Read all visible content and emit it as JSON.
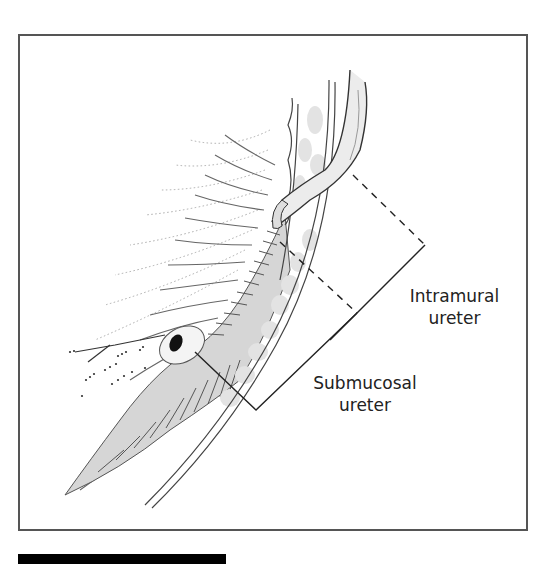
{
  "figure": {
    "labels": {
      "intramural": {
        "line1": "Intramural",
        "line2": "ureter"
      },
      "submucosal": {
        "line1": "Submucosal",
        "line2": "ureter"
      }
    },
    "colors": {
      "frame": "#555555",
      "line": "#333333",
      "shade_light": "#e6e6e6",
      "shade_mid": "#cfcfcf",
      "orifice": "#111111",
      "footer_bar": "#000000"
    },
    "parts": [
      "ureter",
      "ureteral-orifice",
      "bladder-wall",
      "bladder-mucosa",
      "intramural-bracket",
      "submucosal-bracket"
    ]
  }
}
